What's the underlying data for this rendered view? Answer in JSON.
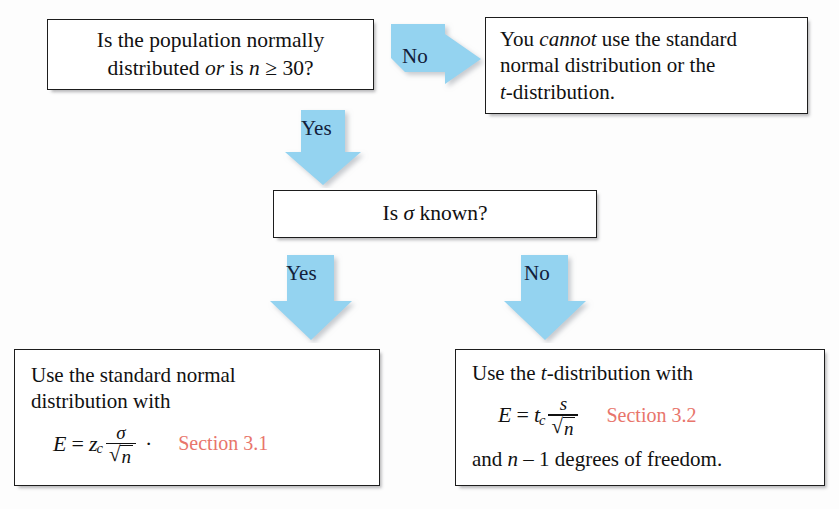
{
  "diagram": {
    "accent_arrow_color": "#94d3f0",
    "section_ref_color": "#e8756b",
    "box_border_color": "#1d1d1d",
    "background_color": "#fdfdfd"
  },
  "nodes": {
    "question_1": {
      "id": "is-population-normal",
      "line1": "Is the population normally",
      "line2_a": "distributed ",
      "line2_or": "or",
      "line2_b": " is ",
      "line2_n": "n",
      "line2_c": " ≥ 30?",
      "full_text": "Is the population normally distributed or is n ≥ 30?"
    },
    "cannot": {
      "id": "cannot-use-distributions",
      "line1_a": "You ",
      "line1_em": "cannot",
      "line1_b": " use the standard",
      "line2": "normal distribution or the",
      "line3_t": "t",
      "line3_b": "-distribution.",
      "full_text": "You cannot use the standard normal distribution or the t-distribution."
    },
    "question_2": {
      "id": "is-sigma-known",
      "prefix": "Is ",
      "symbol": "σ",
      "suffix": " known?",
      "full_text": "Is σ known?"
    },
    "use_z": {
      "id": "use-standard-normal",
      "line1": "Use the standard normal",
      "line2": "distribution with",
      "formula": {
        "lhs": "E",
        "eq": "=",
        "coef": "z",
        "coef_sub": "c",
        "numerator": "σ",
        "radical_sign": "√",
        "denominator": "n",
        "trailing_op": "·",
        "full_text": "E = z_c σ/√n ·"
      },
      "section_ref": "Section 3.1"
    },
    "use_t": {
      "id": "use-t-distribution",
      "line1_a": "Use the ",
      "line1_t": "t",
      "line1_b": "-distribution with",
      "formula": {
        "lhs": "E",
        "eq": "=",
        "coef": "t",
        "coef_sub": "c",
        "numerator": "s",
        "radical_sign": "√",
        "denominator": "n",
        "full_text": "E = t_c s/√n"
      },
      "section_ref": "Section 3.2",
      "line3_a": "and ",
      "line3_n": "n",
      "line3_b": " – 1 degrees of freedom.",
      "line3_full": "and n – 1 degrees of freedom."
    }
  },
  "arrows": [
    {
      "id": "arrow-no-top",
      "label": "No",
      "direction": "right",
      "from": "question_1",
      "to": "cannot"
    },
    {
      "id": "arrow-yes-top",
      "label": "Yes",
      "direction": "down",
      "from": "question_1",
      "to": "question_2"
    },
    {
      "id": "arrow-yes-lower",
      "label": "Yes",
      "direction": "down",
      "from": "question_2",
      "to": "use_z"
    },
    {
      "id": "arrow-no-lower",
      "label": "No",
      "direction": "down",
      "from": "question_2",
      "to": "use_t"
    }
  ]
}
